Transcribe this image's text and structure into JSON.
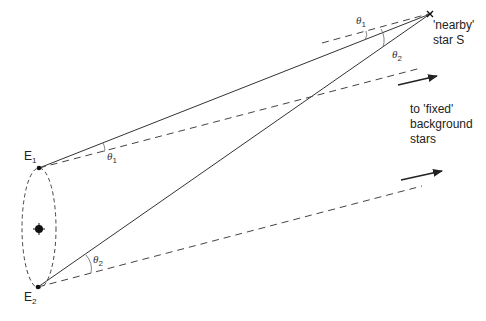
{
  "diagram": {
    "labels": {
      "star": [
        "'nearby'",
        "star S"
      ],
      "background": [
        "to 'fixed'",
        "background",
        "stars"
      ],
      "e1": {
        "letter": "E",
        "sub": "1"
      },
      "e2": {
        "letter": "E",
        "sub": "2"
      },
      "theta1_top": {
        "symbol": "θ",
        "sub": "1"
      },
      "theta1_bottom": {
        "symbol": "θ",
        "sub": "1"
      },
      "theta2_top": {
        "symbol": "θ",
        "sub": "2"
      },
      "theta2_bottom": {
        "symbol": "θ",
        "sub": "2"
      }
    },
    "nodes": {
      "star_S": {
        "x": 430,
        "y": 14
      },
      "E1": {
        "x": 39,
        "y": 168
      },
      "E2": {
        "x": 38,
        "y": 287
      },
      "sun": {
        "x": 39,
        "y": 229
      }
    },
    "edges": [
      {
        "from": "E1",
        "to": "star_S",
        "style": "solid"
      },
      {
        "from": "E2",
        "to": "star_S",
        "style": "solid"
      },
      {
        "from": "E1",
        "to": "background",
        "style": "dashed"
      },
      {
        "from": "E2",
        "to": "background",
        "style": "dashed"
      },
      {
        "from": "star_S",
        "to": "background",
        "style": "dashed",
        "note": "parallel reference line through S"
      }
    ],
    "orbit": {
      "shape": "ellipse",
      "style": "dashed"
    },
    "colors": {
      "line": "#333333",
      "background": "#ffffff"
    }
  }
}
